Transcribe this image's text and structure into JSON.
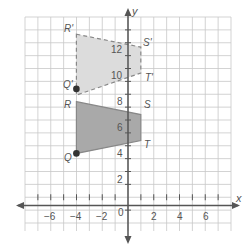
{
  "chart_data": {
    "type": "scatter",
    "title": "",
    "xlabel": "x",
    "ylabel": "y",
    "xlim": [
      -8,
      8
    ],
    "ylim": [
      -2,
      14
    ],
    "grid": true,
    "x_ticks": [
      -6,
      -4,
      -2,
      2,
      4,
      6
    ],
    "y_ticks": [
      2,
      4,
      6,
      8,
      10,
      12
    ],
    "origin_label": "0",
    "shapes": [
      {
        "name": "QRST",
        "style": "solid",
        "fill": "#a9a9a9",
        "vertices": [
          {
            "label": "Q",
            "x": -4,
            "y": 4
          },
          {
            "label": "R",
            "x": -4,
            "y": 8
          },
          {
            "label": "S",
            "x": 1,
            "y": 7
          },
          {
            "label": "T",
            "x": 1,
            "y": 5
          }
        ]
      },
      {
        "name": "Q'R'S'T'",
        "style": "dashed",
        "fill": "#dcdcdc",
        "vertices": [
          {
            "label": "Q'",
            "x": -4,
            "y": 9
          },
          {
            "label": "R'",
            "x": -4,
            "y": 13
          },
          {
            "label": "S'",
            "x": 1,
            "y": 12
          },
          {
            "label": "T'",
            "x": 1,
            "y": 10
          }
        ]
      }
    ],
    "points": [
      {
        "label": "Q",
        "x": -4,
        "y": 4
      },
      {
        "label": "Q'",
        "x": -4,
        "y": 9
      }
    ]
  },
  "labels": {
    "x_axis": "x",
    "y_axis": "y",
    "origin": "0",
    "x_tick_neg6": "−6",
    "x_tick_neg4": "−4",
    "x_tick_neg2": "−2",
    "x_tick_2": "2",
    "x_tick_4": "4",
    "x_tick_6": "6",
    "y_tick_2": "2",
    "y_tick_4": "4",
    "y_tick_6": "6",
    "y_tick_8": "8",
    "y_tick_10": "10",
    "y_tick_12": "12",
    "Q": "Q",
    "R": "R",
    "S": "S",
    "T": "T",
    "Qp": "Q'",
    "Rp": "R'",
    "Sp": "S'",
    "Tp": "T'"
  },
  "colors": {
    "grid": "#c8c8c8",
    "axis": "#555555",
    "original_fill": "#a9a9a9",
    "image_fill": "#dcdcdc",
    "point": "#333333"
  }
}
